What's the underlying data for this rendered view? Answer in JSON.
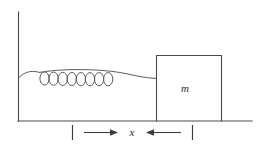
{
  "figure": {
    "background_color": "#ffffff",
    "line_color": "#4a4a4a",
    "label_color": "#2b2b2b",
    "mass_label": "m",
    "displacement_label": "x",
    "spring_coil_count": 8,
    "elements": {
      "wall_name": "vertical wall",
      "floor_name": "horizontal floor",
      "block_name": "block of mass m",
      "spring_name": "coil spring",
      "dimension_name": "displacement dimension x"
    },
    "geometry": {
      "wall_x": 18,
      "wall_top_y": 12,
      "floor_y": 121,
      "floor_right_x": 252,
      "block_left_x": 156,
      "block_right_x": 222,
      "block_top_y": 55,
      "spring_axis_y": 78,
      "dim_line_y": 132,
      "dim_left_tick_x": 72,
      "dim_right_tick_x": 192
    }
  }
}
